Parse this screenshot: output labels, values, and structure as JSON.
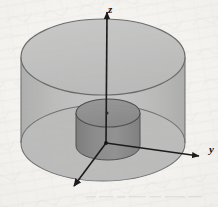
{
  "figure": {
    "name": "coaxial-cylinders-3d-diagram",
    "width": 218,
    "height": 207,
    "background_color": "#f3f2ef",
    "media": "scanned paper, faint handwriting bleed-through texture"
  },
  "axes": {
    "origin": {
      "x": 106,
      "y": 143
    },
    "z": {
      "label": "z",
      "label_x": 108,
      "label_y": 13,
      "tip_x": 107,
      "tip_y": 9,
      "color": "#1c1c1c"
    },
    "y": {
      "label": "y",
      "label_x": 210,
      "label_y": 153,
      "tip_x": 202,
      "tip_y": 156,
      "color": "#1c1c1c"
    },
    "x": {
      "label": "",
      "label_x": 66,
      "label_y": 200,
      "tip_x": 72,
      "tip_y": 189,
      "color": "#1c1c1c"
    }
  },
  "outer_cylinder": {
    "name": "outer-cylinder",
    "center_x": 103,
    "top_y": 57,
    "bottom_y": 143,
    "rx": 82,
    "ry": 38,
    "top_fill": "#b9b9b9",
    "wall_fill": "#b0b0b0",
    "stroke": "#5a5a5a",
    "opacity": 0.86
  },
  "inner_cylinder": {
    "name": "inner-cylinder",
    "center_x": 108,
    "top_y": 113,
    "bottom_y": 146,
    "rx": 32,
    "ry": 14,
    "top_fill": "#8e8e8e",
    "wall_fill": "#858585",
    "stroke": "#4a4a4a",
    "opacity": 0.95
  },
  "colors": {
    "ink": "#1c1c1c",
    "paper": "#f3f2ef",
    "light_gray": "#b9b9b9",
    "dark_gray": "#8e8e8e"
  }
}
